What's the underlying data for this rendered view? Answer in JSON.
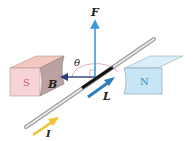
{
  "diagram": {
    "labels": {
      "force": "F",
      "field": "B",
      "length": "L",
      "current": "I",
      "angle": "θ",
      "south_pole": "S",
      "north_pole": "N"
    },
    "colors": {
      "south_face": "#f7d3d8",
      "south_top": "#f4c8bf",
      "south_side": "#b9a29f",
      "south_text": "#d8577a",
      "north_face": "#c6e6f5",
      "north_top": "#d9eef8",
      "north_text": "#3a8fc0",
      "force_arrow": "#3a9ad9",
      "field_arrow": "#2d3f7a",
      "length_arrow": "#2f7fc0",
      "current_arrow": "#f2c230",
      "wire": "#c8c8c8",
      "wire_segment": "#111111",
      "angle_arc": "#d98aa6"
    }
  }
}
